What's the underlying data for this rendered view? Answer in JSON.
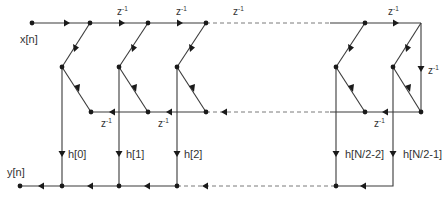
{
  "diagram": {
    "type": "signal-flow-graph",
    "labels": {
      "input": "x[n]",
      "output": "y[n]",
      "delay": "z",
      "delay_exp": "-1"
    },
    "coefficients": [
      {
        "label": "h[0]"
      },
      {
        "label": "h[1]"
      },
      {
        "label": "h[2]"
      },
      {
        "label": "h[N/2-2]"
      },
      {
        "label": "h[N/2-1]"
      }
    ],
    "delay_labels": {
      "top": [
        "z-1",
        "z-1",
        "z-1"
      ],
      "right": "z-1",
      "return": [
        "z-1",
        "z-1",
        "z-1"
      ]
    },
    "colors": {
      "line": "#3a3a3a",
      "dashed": "#7a7a7a",
      "node": "#1a1a1a",
      "text": "#333333"
    }
  }
}
